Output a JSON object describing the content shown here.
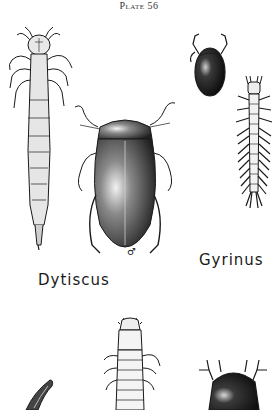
{
  "plate": {
    "title": "Plate 56"
  },
  "labels": {
    "dytiscus": "Dytiscus",
    "gyrinus": "Gyrinus",
    "male_symbol": "♂"
  },
  "figures": [
    {
      "name": "dytiscus-larva",
      "position": "left"
    },
    {
      "name": "dytiscus-adult-male",
      "position": "center"
    },
    {
      "name": "gyrinus-adult",
      "position": "top-right"
    },
    {
      "name": "gyrinus-larva",
      "position": "right"
    },
    {
      "name": "partial-claw",
      "position": "bottom-left"
    },
    {
      "name": "partial-larva",
      "position": "bottom-center"
    },
    {
      "name": "partial-beetle",
      "position": "bottom-right"
    }
  ],
  "colors": {
    "ink": "#1a1a1a",
    "paper": "#ffffff"
  }
}
